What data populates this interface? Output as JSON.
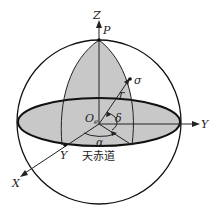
{
  "diagram": {
    "labels": {
      "z_axis": "Z",
      "pole": "P",
      "star": "σ",
      "radius": "r",
      "origin": "O",
      "origin_sub": "e",
      "declination": "δ",
      "right_ascension": "α",
      "y_axis": "Y",
      "vernal_point": "Y",
      "x_axis": "X",
      "equator": "天赤道"
    }
  }
}
